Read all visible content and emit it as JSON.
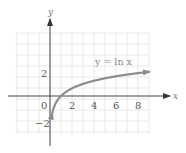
{
  "chart_data": {
    "type": "line",
    "title": "",
    "xlabel": "x",
    "ylabel": "y",
    "x_ticks": [
      "0",
      "2",
      "4",
      "6",
      "8"
    ],
    "y_ticks": [
      "2",
      "-2"
    ],
    "xlim": [
      -3,
      9
    ],
    "ylim": [
      -3.5,
      5.5
    ],
    "grid": true,
    "legend": null,
    "series": [
      {
        "name": "y = ln x",
        "function": "ln(x)",
        "x": [
          0.2,
          0.5,
          1,
          2,
          3,
          4,
          5,
          6,
          7,
          8,
          9
        ],
        "y": [
          -1.61,
          -0.69,
          0,
          0.69,
          1.1,
          1.39,
          1.61,
          1.79,
          1.95,
          2.08,
          2.2
        ]
      }
    ],
    "annotations": [
      {
        "text": "y = ln x",
        "near": [
          6,
          2.6
        ]
      }
    ]
  },
  "labels": {
    "x_axis": "x",
    "y_axis": "y",
    "curve": "y = ln x",
    "origin": "0",
    "x2": "2",
    "x4": "4",
    "x6": "6",
    "x8": "8",
    "y2": "2",
    "ym2": "−2"
  },
  "colors": {
    "curve": "#8c8c8c",
    "grid": "#e2e2e2",
    "axis": "#444444"
  }
}
